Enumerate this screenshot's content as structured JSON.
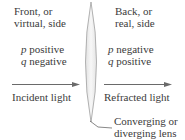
{
  "diagram": {
    "front_side": {
      "line1": "Front, or",
      "line2": "virtual, side",
      "p_var": "p",
      "p_sign": "positive",
      "q_var": "q",
      "q_sign": "negative"
    },
    "back_side": {
      "line1": "Back, or",
      "line2": "real, side",
      "p_var": "p",
      "p_sign": "negative",
      "q_var": "q",
      "q_sign": "positive"
    },
    "incident_label": "Incident light",
    "refracted_label": "Refracted light",
    "lens_label": {
      "line1": "Converging or",
      "line2": "diverging lens"
    },
    "colors": {
      "text": "#3b3b3b",
      "arrow": "#6a6a6a",
      "lens_fill": "#eeeeee",
      "lens_stroke": "#9a9a9a"
    }
  }
}
